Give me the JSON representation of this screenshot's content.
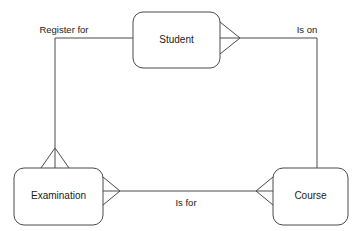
{
  "diagram": {
    "type": "entity-relationship-diagram",
    "notation": "crows-foot",
    "background_color": "#ffffff",
    "line_color": "#4a4a4a",
    "text_color": "#1a1a1a",
    "entities": [
      {
        "id": "student",
        "label": "Student",
        "x": 133,
        "y": 12,
        "width": 87,
        "height": 56,
        "corner_radius": 10
      },
      {
        "id": "examination",
        "label": "Examination",
        "x": 14,
        "y": 168,
        "width": 89,
        "height": 57,
        "corner_radius": 10
      },
      {
        "id": "course",
        "label": "Course",
        "x": 273,
        "y": 168,
        "width": 75,
        "height": 57,
        "corner_radius": 10
      }
    ],
    "relationships": [
      {
        "id": "register-for",
        "label": "Register for",
        "from": "examination",
        "to": "student",
        "label_x": 64,
        "label_y": 30,
        "crowsfoot_at": "examination-top"
      },
      {
        "id": "is-on",
        "label": "Is on",
        "from": "student",
        "to": "course",
        "label_x": 307,
        "label_y": 30,
        "crowsfoot_at": "student-right"
      },
      {
        "id": "is-for",
        "label": "Is for",
        "from": "examination",
        "to": "course",
        "label_x": 186,
        "label_y": 203,
        "crowsfoot_at": "examination-right,course-left"
      }
    ]
  }
}
